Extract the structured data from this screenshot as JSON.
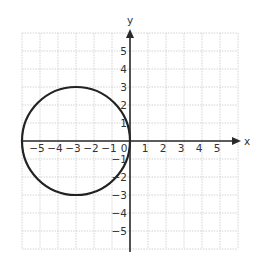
{
  "chart_data": {
    "type": "line",
    "title": "",
    "xlabel": "x",
    "ylabel": "y",
    "xlim": [
      -6,
      6
    ],
    "ylim": [
      -6,
      6
    ],
    "grid": true,
    "x_ticks": [
      -5,
      -4,
      -3,
      -2,
      -1,
      0,
      1,
      2,
      3,
      4,
      5
    ],
    "y_ticks": [
      -5,
      -4,
      -3,
      -2,
      -1,
      1,
      2,
      3,
      4,
      5
    ],
    "x_tick_labels": [
      "−5",
      "−4",
      "−3",
      "−2",
      "−1",
      "0",
      "1",
      "2",
      "3",
      "4",
      "5"
    ],
    "y_tick_labels": [
      "−5",
      "−4",
      "−3",
      "−2",
      "−1",
      "1",
      "2",
      "3",
      "4",
      "5"
    ],
    "series": [
      {
        "name": "circle",
        "shape": "circle",
        "center": [
          -3,
          0
        ],
        "radius": 3,
        "equation": "(x + 3)^2 + y^2 = 9",
        "color": "#222222"
      }
    ]
  },
  "layout": {
    "origin_px": [
      130,
      141
    ],
    "unit_px": 18
  }
}
